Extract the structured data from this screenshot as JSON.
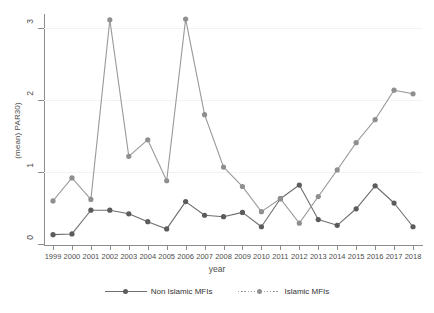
{
  "chart_data": {
    "type": "line",
    "title": "",
    "xlabel": "year",
    "ylabel": "(mean) PAR30)",
    "x": [
      1999,
      2000,
      2001,
      2002,
      2003,
      2004,
      2005,
      2006,
      2007,
      2008,
      2009,
      2010,
      2011,
      2012,
      2013,
      2014,
      2015,
      2016,
      2017,
      2018
    ],
    "categories": [
      "1999",
      "2000",
      "2001",
      "2002",
      "2003",
      "2004",
      "2005",
      "2006",
      "2007",
      "2008",
      "2009",
      "2010",
      "2011",
      "2012",
      "2013",
      "2014",
      "2015",
      "2016",
      "2017",
      "2018"
    ],
    "xlim": [
      1999,
      2018
    ],
    "ylim": [
      0,
      0.32
    ],
    "yticks": [
      0,
      0.1,
      0.2,
      0.3
    ],
    "ytick_labels": [
      "0",
      ".1",
      ".2",
      ".3"
    ],
    "grid": true,
    "legend_position": "bottom",
    "series": [
      {
        "name": "Non Islamic MFIs",
        "style": "solid",
        "color": "#6e6e6e",
        "marker_color": "#5c5c5c",
        "values": [
          0.013,
          0.014,
          0.047,
          0.047,
          0.042,
          0.031,
          0.021,
          0.059,
          0.04,
          0.038,
          0.044,
          0.024,
          0.063,
          0.082,
          0.034,
          0.026,
          0.049,
          0.081,
          0.057,
          0.024
        ]
      },
      {
        "name": "Islamic MFIs",
        "style": "dotted",
        "color": "#9a9a9a",
        "marker_color": "#8f8f8f",
        "values": [
          0.06,
          0.092,
          0.062,
          0.312,
          0.122,
          0.145,
          0.088,
          0.313,
          0.18,
          0.107,
          0.08,
          0.045,
          0.063,
          0.029,
          0.066,
          0.103,
          0.141,
          0.173,
          0.214,
          0.209
        ]
      }
    ]
  },
  "axis": {
    "y_title": "(mean) PAR30)",
    "x_title": "year",
    "y_tick_labels": [
      "3",
      "2",
      "1",
      "0"
    ],
    "x_tick_labels": [
      "1999",
      "2000",
      "2001",
      "2002",
      "2003",
      "2004",
      "2005",
      "2006",
      "2007",
      "2008",
      "2009",
      "2010",
      "2011",
      "2012",
      "2013",
      "2014",
      "2015",
      "2016",
      "2017",
      "2018"
    ]
  },
  "legend": {
    "items": [
      {
        "label": "Non Islamic MFIs"
      },
      {
        "label": "Islamic MFIs"
      }
    ]
  },
  "colors": {
    "series_non_islamic": "#6e6e6e",
    "series_islamic": "#9a9a9a",
    "axis": "#8c8c8c",
    "grid": "#f2f2f2",
    "text": "#4d4d4d",
    "background": "#ffffff"
  }
}
